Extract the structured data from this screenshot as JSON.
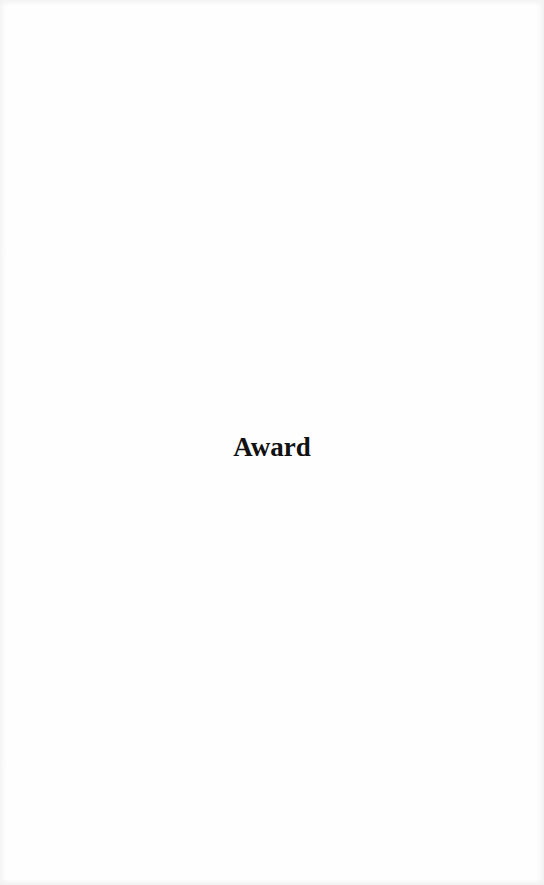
{
  "page": {
    "heading": "Award",
    "colors": {
      "background": "#fefefe",
      "text": "#111111"
    }
  }
}
